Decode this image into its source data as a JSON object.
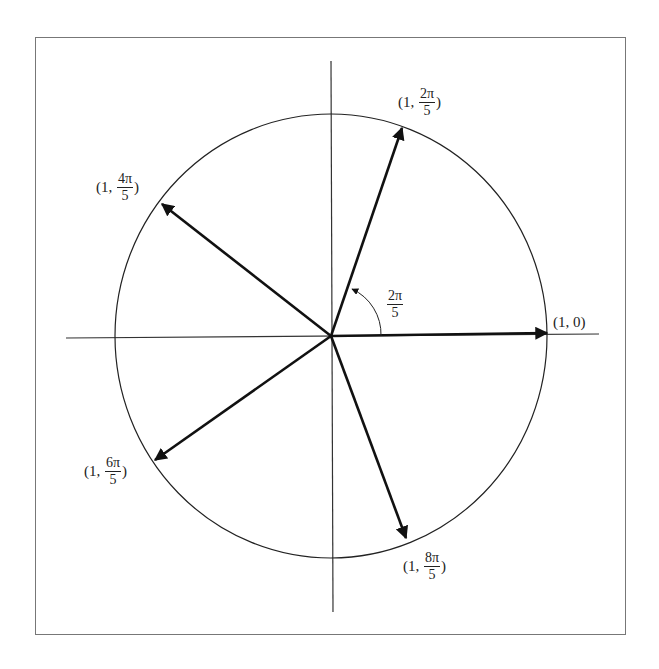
{
  "diagram": {
    "title": "",
    "angle_label": {
      "num": "2π",
      "den": "5"
    },
    "points": [
      {
        "prefix": "(1, ",
        "value": "0",
        "suffix": ")",
        "is_fraction": false,
        "angle_deg": 0
      },
      {
        "prefix": "(1, ",
        "num": "2π",
        "den": "5",
        "suffix": ")",
        "is_fraction": true,
        "angle_deg": 72
      },
      {
        "prefix": "(1, ",
        "num": "4π",
        "den": "5",
        "suffix": ")",
        "is_fraction": true,
        "angle_deg": 144
      },
      {
        "prefix": "(1, ",
        "num": "6π",
        "den": "5",
        "suffix": ")",
        "is_fraction": true,
        "angle_deg": 216
      },
      {
        "prefix": "(1, ",
        "num": "8π",
        "den": "5",
        "suffix": ")",
        "is_fraction": true,
        "angle_deg": 288
      }
    ],
    "colors": {
      "line": "#111111",
      "frame": "#777777",
      "background": "#ffffff"
    }
  }
}
